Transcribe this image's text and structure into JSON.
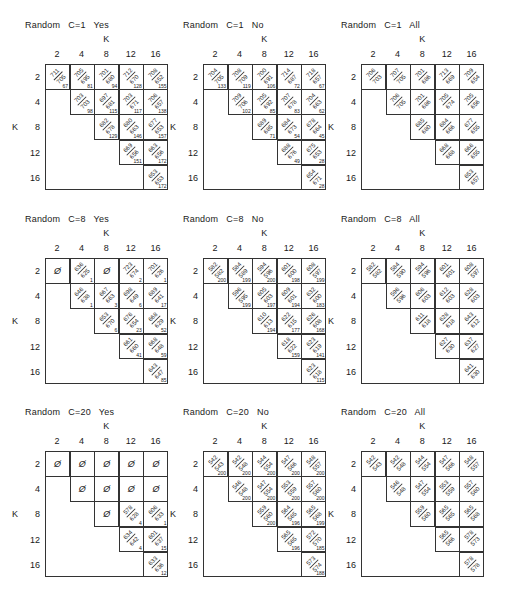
{
  "figure": {
    "axis_label": "K",
    "k_values": [
      "2",
      "4",
      "8",
      "12",
      "16"
    ],
    "empty_symbol": "Ø"
  },
  "panels": [
    {
      "title": "Random   C=1   Yes",
      "cells": [
        [
          {
            "num": "711",
            "den": "705",
            "count": "67"
          },
          {
            "num": "705",
            "den": "695",
            "count": "81"
          },
          {
            "num": "701",
            "den": "680",
            "count": "94"
          },
          {
            "num": "712",
            "den": "670",
            "count": "128"
          },
          {
            "num": "708",
            "den": "652",
            "count": "155"
          }
        ],
        [
          null,
          {
            "num": "703",
            "den": "703",
            "count": "98"
          },
          {
            "num": "697",
            "den": "681",
            "count": "115"
          },
          {
            "num": "703",
            "den": "671",
            "count": "117"
          },
          {
            "num": "706",
            "den": "657",
            "count": "138"
          }
        ],
        [
          null,
          null,
          {
            "num": "682",
            "den": "678",
            "count": "129"
          },
          {
            "num": "680",
            "den": "663",
            "count": "146"
          },
          {
            "num": "677",
            "den": "653",
            "count": "157"
          }
        ],
        [
          null,
          null,
          null,
          {
            "num": "669",
            "den": "656",
            "count": "151"
          },
          {
            "num": "663",
            "den": "656",
            "count": "172"
          }
        ],
        [
          null,
          null,
          null,
          null,
          {
            "num": "653",
            "den": "653",
            "count": "172"
          }
        ]
      ]
    },
    {
      "title": "Random   C=1   No",
      "cells": [
        [
          {
            "num": "704",
            "den": "705",
            "count": "133"
          },
          {
            "num": "708",
            "den": "709",
            "count": "119"
          },
          {
            "num": "700",
            "den": "691",
            "count": "106"
          },
          {
            "num": "714",
            "den": "687",
            "count": "72"
          },
          {
            "num": "718",
            "den": "657",
            "count": "67"
          }
        ],
        [
          null,
          {
            "num": "709",
            "den": "706",
            "count": "102"
          },
          {
            "num": "705",
            "den": "692",
            "count": "85"
          },
          {
            "num": "707",
            "den": "678",
            "count": "83"
          },
          {
            "num": "704",
            "den": "663",
            "count": "62"
          }
        ],
        [
          null,
          null,
          {
            "num": "689",
            "den": "685",
            "count": "71"
          },
          {
            "num": "684",
            "den": "673",
            "count": "54"
          },
          {
            "num": "678",
            "den": "664",
            "count": "45"
          }
        ],
        [
          null,
          null,
          null,
          {
            "num": "688",
            "den": "676",
            "count": "49"
          },
          {
            "num": "675",
            "den": "653",
            "count": "28"
          }
        ],
        [
          null,
          null,
          null,
          null,
          {
            "num": "654",
            "den": "671",
            "count": "28"
          }
        ]
      ]
    },
    {
      "title": "Random   C=1   All",
      "cells": [
        [
          {
            "num": "706",
            "den": "703",
            "count": ""
          },
          {
            "num": "707",
            "den": "705",
            "count": ""
          },
          {
            "num": "701",
            "den": "686",
            "count": ""
          },
          {
            "num": "713",
            "den": "669",
            "count": ""
          },
          {
            "num": "709",
            "den": "654",
            "count": ""
          }
        ],
        [
          null,
          {
            "num": "706",
            "den": "705",
            "count": ""
          },
          {
            "num": "701",
            "den": "686",
            "count": ""
          },
          {
            "num": "705",
            "den": "674",
            "count": ""
          },
          {
            "num": "705",
            "den": "656",
            "count": ""
          }
        ],
        [
          null,
          null,
          {
            "num": "685",
            "den": "680",
            "count": ""
          },
          {
            "num": "684",
            "den": "666",
            "count": ""
          },
          {
            "num": "677",
            "den": "655",
            "count": ""
          }
        ],
        [
          null,
          null,
          null,
          {
            "num": "668",
            "den": "668",
            "count": ""
          },
          {
            "num": "666",
            "den": "655",
            "count": ""
          }
        ],
        [
          null,
          null,
          null,
          null,
          {
            "num": "653",
            "den": "657",
            "count": ""
          }
        ]
      ]
    },
    {
      "title": "Random   C=8   Yes",
      "cells": [
        [
          {
            "empty": true
          },
          {
            "num": "636",
            "den": "625",
            "count": "1"
          },
          {
            "empty": true
          },
          {
            "num": "723",
            "den": "674",
            "count": "2"
          },
          {
            "num": "701",
            "den": "626",
            "count": "1"
          }
        ],
        [
          null,
          {
            "num": "646",
            "den": "638",
            "count": "1"
          },
          {
            "num": "667",
            "den": "663",
            "count": "3"
          },
          {
            "num": "698",
            "den": "649",
            "count": "6"
          },
          {
            "num": "689",
            "den": "641",
            "count": "17"
          }
        ],
        [
          null,
          null,
          {
            "num": "653",
            "den": "670",
            "count": "6"
          },
          {
            "num": "676",
            "den": "654",
            "count": "23"
          },
          {
            "num": "668",
            "den": "629",
            "count": "52"
          }
        ],
        [
          null,
          null,
          null,
          {
            "num": "661",
            "den": "660",
            "count": "41"
          },
          {
            "num": "668",
            "den": "648",
            "count": "59"
          }
        ],
        [
          null,
          null,
          null,
          null,
          {
            "num": "643",
            "den": "647",
            "count": "85"
          }
        ]
      ]
    },
    {
      "title": "Random   C=8   No",
      "cells": [
        [
          {
            "num": "582",
            "den": "582",
            "count": "200"
          },
          {
            "num": "584",
            "den": "589",
            "count": "199"
          },
          {
            "num": "594",
            "den": "596",
            "count": "200"
          },
          {
            "num": "601",
            "den": "600",
            "count": "198"
          },
          {
            "num": "608",
            "den": "597",
            "count": "199"
          }
        ],
        [
          null,
          {
            "num": "596",
            "den": "595",
            "count": "199"
          },
          {
            "num": "605",
            "den": "603",
            "count": "197"
          },
          {
            "num": "609",
            "den": "601",
            "count": "194"
          },
          {
            "num": "632",
            "den": "600",
            "count": "183"
          }
        ],
        [
          null,
          null,
          {
            "num": "610",
            "den": "613",
            "count": "194"
          },
          {
            "num": "622",
            "den": "615",
            "count": "177"
          },
          {
            "num": "626",
            "den": "608",
            "count": "168"
          }
        ],
        [
          null,
          null,
          null,
          {
            "num": "618",
            "den": "622",
            "count": "159"
          },
          {
            "num": "623",
            "den": "619",
            "count": "141"
          }
        ],
        [
          null,
          null,
          null,
          null,
          {
            "num": "623",
            "den": "618",
            "count": "115"
          }
        ]
      ]
    },
    {
      "title": "Random   C=8   All",
      "cells": [
        [
          {
            "num": "582",
            "den": "582",
            "count": ""
          },
          {
            "num": "584",
            "den": "590",
            "count": ""
          },
          {
            "num": "594",
            "den": "596",
            "count": ""
          },
          {
            "num": "601",
            "den": "601",
            "count": ""
          },
          {
            "num": "608",
            "den": "597",
            "count": ""
          }
        ],
        [
          null,
          {
            "num": "596",
            "den": "596",
            "count": ""
          },
          {
            "num": "606",
            "den": "603",
            "count": ""
          },
          {
            "num": "612",
            "den": "603",
            "count": ""
          },
          {
            "num": "628",
            "den": "603",
            "count": ""
          }
        ],
        [
          null,
          null,
          {
            "num": "611",
            "den": "618",
            "count": ""
          },
          {
            "num": "628",
            "den": "618",
            "count": ""
          },
          {
            "num": "643",
            "den": "612",
            "count": ""
          }
        ],
        [
          null,
          null,
          null,
          {
            "num": "627",
            "den": "630",
            "count": ""
          },
          {
            "num": "637",
            "den": "627",
            "count": ""
          }
        ],
        [
          null,
          null,
          null,
          null,
          {
            "num": "641",
            "den": "630",
            "count": ""
          }
        ]
      ]
    },
    {
      "title": "Random   C=20   Yes",
      "cells": [
        [
          {
            "empty": true
          },
          {
            "empty": true
          },
          {
            "empty": true
          },
          {
            "empty": true
          },
          {
            "empty": true
          }
        ],
        [
          null,
          {
            "empty": true
          },
          {
            "empty": true
          },
          {
            "empty": true
          },
          {
            "empty": true
          }
        ],
        [
          null,
          null,
          {
            "empty": true
          },
          {
            "num": "578",
            "den": "628",
            "count": "4"
          },
          {
            "num": "606",
            "den": "633",
            "count": "1"
          }
        ],
        [
          null,
          null,
          null,
          {
            "num": "634",
            "den": "642",
            "count": "4"
          },
          {
            "num": "601",
            "den": "637",
            "count": "15"
          }
        ],
        [
          null,
          null,
          null,
          null,
          {
            "num": "633",
            "den": "636",
            "count": "12"
          }
        ]
      ]
    },
    {
      "title": "Random   C=20   No",
      "cells": [
        [
          {
            "num": "542",
            "den": "543",
            "count": "200"
          },
          {
            "num": "542",
            "den": "548",
            "count": "200"
          },
          {
            "num": "544",
            "den": "554",
            "count": "200"
          },
          {
            "num": "547",
            "den": "566",
            "count": "200"
          },
          {
            "num": "548",
            "den": "557",
            "count": "200"
          }
        ],
        [
          null,
          {
            "num": "546",
            "den": "548",
            "count": "200"
          },
          {
            "num": "547",
            "den": "554",
            "count": "200"
          },
          {
            "num": "553",
            "den": "559",
            "count": "200"
          },
          {
            "num": "557",
            "den": "560",
            "count": "200"
          }
        ],
        [
          null,
          null,
          {
            "num": "559",
            "den": "560",
            "count": "200"
          },
          {
            "num": "564",
            "den": "565",
            "count": "196"
          },
          {
            "num": "565",
            "den": "568",
            "count": "199"
          }
        ],
        [
          null,
          null,
          null,
          {
            "num": "565",
            "den": "565",
            "count": "196"
          },
          {
            "num": "572",
            "den": "570",
            "count": "185"
          }
        ],
        [
          null,
          null,
          null,
          null,
          {
            "num": "573",
            "den": "574",
            "count": "188"
          }
        ]
      ]
    },
    {
      "title": "Random   C=20   All",
      "cells": [
        [
          {
            "num": "542",
            "den": "543",
            "count": ""
          },
          {
            "num": "542",
            "den": "548",
            "count": ""
          },
          {
            "num": "544",
            "den": "554",
            "count": ""
          },
          {
            "num": "547",
            "den": "566",
            "count": ""
          },
          {
            "num": "548",
            "den": "557",
            "count": ""
          }
        ],
        [
          null,
          {
            "num": "546",
            "den": "548",
            "count": ""
          },
          {
            "num": "547",
            "den": "554",
            "count": ""
          },
          {
            "num": "553",
            "den": "559",
            "count": ""
          },
          {
            "num": "557",
            "den": "560",
            "count": ""
          }
        ],
        [
          null,
          null,
          {
            "num": "559",
            "den": "560",
            "count": ""
          },
          {
            "num": "565",
            "den": "565",
            "count": ""
          },
          {
            "num": "565",
            "den": "568",
            "count": ""
          }
        ],
        [
          null,
          null,
          null,
          {
            "num": "565",
            "den": "566",
            "count": ""
          },
          {
            "num": "578",
            "den": "573",
            "count": ""
          }
        ],
        [
          null,
          null,
          null,
          null,
          {
            "num": "578",
            "den": "578",
            "count": ""
          }
        ]
      ]
    }
  ],
  "chart_data": {
    "type": "table",
    "row_axis": "K",
    "col_axis": "K",
    "k_values": [
      2,
      4,
      8,
      12,
      16
    ],
    "note": "Each cell shows a fraction num/den rotated 45°, with a count in the lower-right corner (Yes/No panels). Ø = empty cell."
  }
}
